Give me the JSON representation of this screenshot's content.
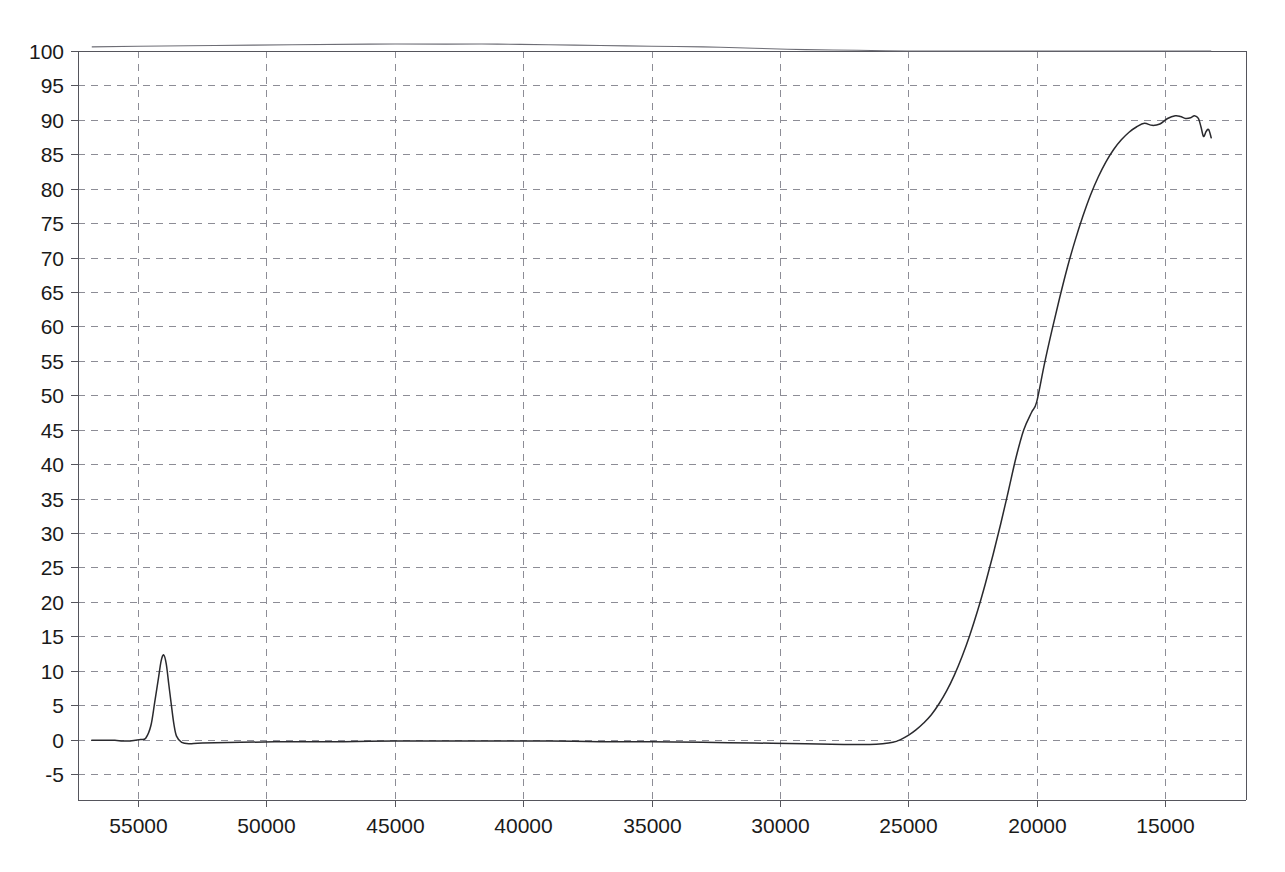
{
  "chart_data": {
    "type": "line",
    "title": "",
    "subtitle": "",
    "xlabel": "",
    "ylabel": "",
    "xlim": [
      56800,
      13200
    ],
    "ylim": [
      -7.0,
      101.5
    ],
    "x_reversed": true,
    "grid": true,
    "legend": "none",
    "x_ticks": [
      55000,
      50000,
      45000,
      40000,
      35000,
      30000,
      25000,
      20000,
      15000
    ],
    "x_tick_labels": [
      "55000",
      "50000",
      "45000",
      "40000",
      "35000",
      "30000",
      "25000",
      "20000",
      "15000"
    ],
    "y_ticks": [
      -5,
      0,
      5,
      10,
      15,
      20,
      25,
      30,
      35,
      40,
      45,
      50,
      55,
      60,
      65,
      70,
      75,
      80,
      85,
      90,
      95,
      100
    ],
    "y_tick_labels": [
      "-5",
      "0",
      "5",
      "10",
      "15",
      "20",
      "25",
      "30",
      "35",
      "40",
      "45",
      "50",
      "55",
      "60",
      "65",
      "70",
      "75",
      "80",
      "85",
      "90",
      "95",
      "100"
    ],
    "series": [
      {
        "name": "reference-baseline",
        "color": "#6d6d75",
        "x": [
          56800,
          55000,
          52000,
          49000,
          46000,
          43000,
          41000,
          39000,
          37000,
          35000,
          33000,
          31000,
          29000,
          27000,
          25000,
          23000,
          21000,
          19000,
          17000,
          15000,
          13200
        ],
        "values": [
          100.6,
          100.7,
          100.8,
          100.9,
          101.0,
          101.0,
          101.0,
          100.9,
          100.8,
          100.7,
          100.6,
          100.4,
          100.2,
          100.1,
          100.0,
          100.0,
          100.0,
          100.0,
          100.0,
          100.0,
          100.0
        ]
      },
      {
        "name": "transmittance",
        "color": "#2a2a2e",
        "x": [
          56800,
          56300,
          55900,
          55600,
          55300,
          55100,
          54900,
          54700,
          54500,
          54350,
          54200,
          54100,
          54000,
          53900,
          53800,
          53700,
          53600,
          53500,
          53300,
          53000,
          52500,
          51000,
          49000,
          47000,
          45000,
          43000,
          41000,
          39000,
          37000,
          35000,
          33000,
          31000,
          29000,
          27500,
          26500,
          26000,
          25600,
          25300,
          25000,
          24700,
          24400,
          24100,
          23800,
          23500,
          23200,
          22900,
          22600,
          22300,
          22000,
          21700,
          21400,
          21100,
          20800,
          20500,
          20200,
          20000,
          19700,
          19400,
          19100,
          18800,
          18500,
          18200,
          17900,
          17600,
          17300,
          17000,
          16700,
          16400,
          16100,
          15800,
          15500,
          15200,
          14900,
          14600,
          14400,
          14200,
          14000,
          13850,
          13700,
          13600,
          13500,
          13400,
          13300,
          13200
        ],
        "values": [
          -0.1,
          -0.1,
          -0.1,
          -0.2,
          -0.2,
          -0.1,
          0.0,
          0.2,
          2.0,
          5.4,
          9.0,
          11.4,
          12.3,
          11.0,
          8.0,
          5.0,
          2.2,
          0.5,
          -0.4,
          -0.6,
          -0.5,
          -0.4,
          -0.3,
          -0.3,
          -0.2,
          -0.2,
          -0.2,
          -0.2,
          -0.3,
          -0.3,
          -0.4,
          -0.5,
          -0.6,
          -0.7,
          -0.7,
          -0.6,
          -0.4,
          0.0,
          0.6,
          1.4,
          2.4,
          3.6,
          5.2,
          7.1,
          9.4,
          12.1,
          15.2,
          18.7,
          22.6,
          26.8,
          31.3,
          36.1,
          41.0,
          45.0,
          47.5,
          49.0,
          54.5,
          59.5,
          64.2,
          68.6,
          72.5,
          76.0,
          79.1,
          81.7,
          83.9,
          85.7,
          87.1,
          88.2,
          89.0,
          89.5,
          89.2,
          89.4,
          90.2,
          90.6,
          90.5,
          90.2,
          90.3,
          90.6,
          90.2,
          89.0,
          87.6,
          88.3,
          88.6,
          87.4
        ]
      }
    ]
  }
}
